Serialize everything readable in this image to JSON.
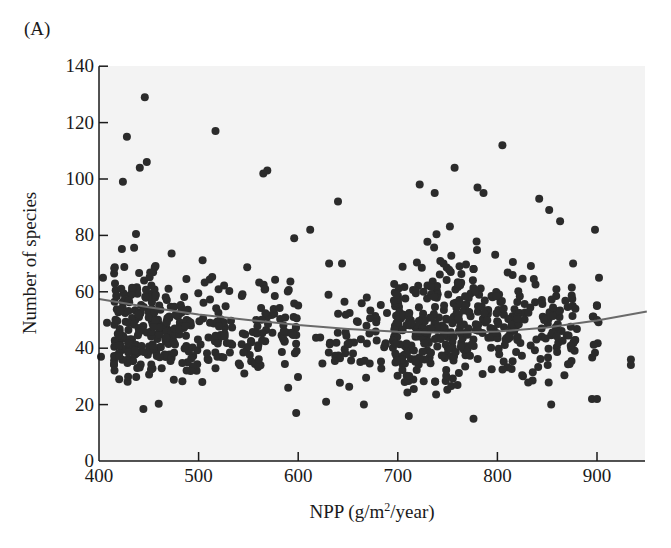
{
  "panel_label": "(A)",
  "colors": {
    "plot_background": "#f3f3f3",
    "point": "#2b2b2b",
    "curve": "#6a6a6a",
    "axis": "#1a1a1a"
  },
  "chart_data": {
    "type": "scatter",
    "title": "",
    "panel": "(A)",
    "xlabel": "NPP (g/m2/year)",
    "xlabel_parts": {
      "pre": "NPP (g/m",
      "sup": "2",
      "post": "/year)"
    },
    "ylabel": "Number of species",
    "xlim": [
      400,
      950
    ],
    "ylim": [
      0,
      140
    ],
    "xticks": [
      400,
      500,
      600,
      700,
      800,
      900
    ],
    "yticks": [
      0,
      20,
      40,
      60,
      80,
      100,
      120,
      140
    ],
    "grid": false,
    "legend": null,
    "fit_curve": {
      "type": "quadratic",
      "x": [
        400,
        450,
        500,
        550,
        600,
        650,
        700,
        750,
        800,
        850,
        900,
        950
      ],
      "y": [
        57.5,
        54.5,
        52,
        50,
        48.2,
        46.8,
        45.8,
        45.5,
        45.9,
        47.3,
        49.8,
        53
      ]
    },
    "clusters": [
      {
        "x_range": [
          415,
          475
        ],
        "y_range": [
          15,
          97
        ],
        "n": 200,
        "y_center": 50
      },
      {
        "x_range": [
          475,
          535
        ],
        "y_range": [
          16,
          92
        ],
        "n": 95,
        "y_center": 50
      },
      {
        "x_range": [
          540,
          600
        ],
        "y_range": [
          15,
          90
        ],
        "n": 75,
        "y_center": 48
      },
      {
        "x_range": [
          615,
          690
        ],
        "y_range": [
          18,
          80
        ],
        "n": 55,
        "y_center": 40
      },
      {
        "x_range": [
          695,
          760
        ],
        "y_range": [
          15,
          98
        ],
        "n": 210,
        "y_center": 40
      },
      {
        "x_range": [
          760,
          820
        ],
        "y_range": [
          17,
          98
        ],
        "n": 130,
        "y_center": 50
      },
      {
        "x_range": [
          820,
          880
        ],
        "y_range": [
          18,
          92
        ],
        "n": 90,
        "y_center": 52
      },
      {
        "x_range": [
          895,
          902
        ],
        "y_range": [
          22,
          82
        ],
        "n": 8,
        "y_center": 45
      }
    ],
    "outliers": [
      [
        446,
        129
      ],
      [
        428,
        115
      ],
      [
        517,
        117
      ],
      [
        404,
        65
      ],
      [
        402,
        37
      ],
      [
        408,
        49
      ],
      [
        424,
        99
      ],
      [
        441,
        104
      ],
      [
        448,
        106
      ],
      [
        565,
        102
      ],
      [
        569,
        103
      ],
      [
        640,
        92
      ],
      [
        722,
        98
      ],
      [
        757,
        104
      ],
      [
        805,
        112
      ],
      [
        612,
        82
      ],
      [
        596,
        79
      ],
      [
        631,
        70
      ],
      [
        644,
        70
      ],
      [
        898,
        82
      ],
      [
        902,
        65
      ],
      [
        876,
        70
      ],
      [
        934,
        36
      ],
      [
        934,
        34
      ],
      [
        863,
        85
      ],
      [
        842,
        93
      ],
      [
        852,
        89
      ],
      [
        900,
        55
      ],
      [
        900,
        50
      ],
      [
        895,
        22
      ],
      [
        900,
        22
      ],
      [
        590,
        26
      ],
      [
        598,
        17
      ],
      [
        628,
        21
      ],
      [
        666,
        20
      ],
      [
        711,
        16
      ],
      [
        776,
        15
      ],
      [
        854,
        20
      ],
      [
        786,
        95
      ],
      [
        780,
        97
      ],
      [
        737,
        95
      ]
    ]
  }
}
